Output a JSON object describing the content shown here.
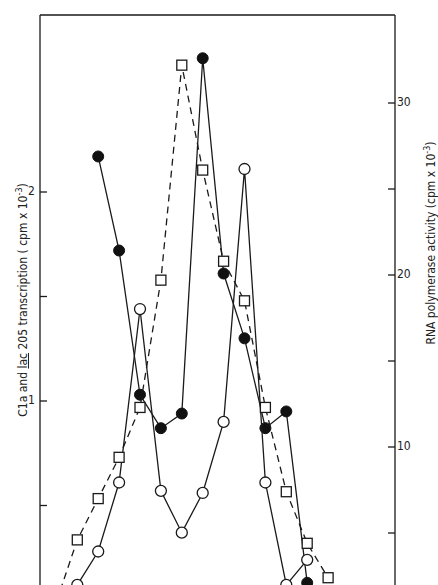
{
  "chart_data": {
    "type": "line",
    "title": "",
    "xlabel": "",
    "ylabel_left": {
      "prefix": "C1a and ",
      "underlined": "lac",
      "suffix": " 205 transcription ( cpm x 10",
      "exponent": "-3",
      "close": ")"
    },
    "ylabel_right": {
      "text": "RNA polymerase activity (cpm x 10",
      "exponent": "-3",
      "close": ")"
    },
    "left_axis": {
      "ticks": [
        0.5,
        1,
        1.5,
        2
      ],
      "tick_labels": {
        "1": "1",
        "2": "2"
      },
      "ylim": [
        0,
        2.85
      ]
    },
    "right_axis": {
      "ticks": [
        5,
        10,
        15,
        20,
        25,
        30
      ],
      "tick_labels": {
        "10": "10",
        "20": "20",
        "30": "30"
      },
      "ylim": [
        0,
        35
      ]
    },
    "x": [
      1,
      2,
      3,
      4,
      5,
      6,
      7,
      8,
      9,
      10,
      11,
      12,
      13,
      14
    ],
    "grid": false,
    "legend": "none",
    "series": [
      {
        "name": "filled-circles",
        "marker": "filled-circle",
        "line": "solid",
        "axis": "left",
        "points": [
          [
            3,
            2.17
          ],
          [
            4,
            1.72
          ],
          [
            5,
            1.03
          ],
          [
            6,
            0.87
          ],
          [
            7,
            0.94
          ],
          [
            8,
            2.64
          ],
          [
            9,
            1.61
          ],
          [
            10,
            1.3
          ],
          [
            11,
            0.87
          ],
          [
            12,
            0.95
          ],
          [
            13,
            0.13
          ]
        ]
      },
      {
        "name": "open-circles",
        "marker": "open-circle",
        "line": "solid",
        "axis": "left",
        "points": [
          [
            2,
            0.12
          ],
          [
            3,
            0.28
          ],
          [
            4,
            0.61
          ],
          [
            5,
            1.44
          ],
          [
            6,
            0.57
          ],
          [
            7,
            0.37
          ],
          [
            8,
            0.56
          ],
          [
            9,
            0.9
          ],
          [
            10,
            2.11
          ],
          [
            11,
            0.61
          ],
          [
            12,
            0.12
          ],
          [
            13,
            0.24
          ]
        ]
      },
      {
        "name": "open-squares",
        "marker": "open-square",
        "line": "dashed",
        "axis": "right",
        "points": [
          [
            1,
            1.0
          ],
          [
            2,
            4.6
          ],
          [
            3,
            7.0
          ],
          [
            4,
            9.4
          ],
          [
            5,
            12.3
          ],
          [
            6,
            19.7
          ],
          [
            7,
            32.2
          ],
          [
            8,
            26.1
          ],
          [
            9,
            20.8
          ],
          [
            10,
            18.5
          ],
          [
            11,
            12.3
          ],
          [
            12,
            7.4
          ],
          [
            13,
            4.4
          ],
          [
            14,
            2.4
          ]
        ]
      }
    ]
  }
}
